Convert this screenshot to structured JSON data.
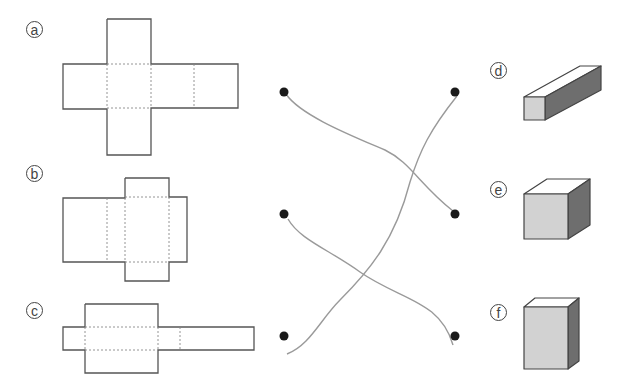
{
  "nets": [
    {
      "id": "a",
      "label": "a",
      "description": "cross-shaped cube net"
    },
    {
      "id": "b",
      "label": "b",
      "description": "box net with short flaps"
    },
    {
      "id": "c",
      "label": "c",
      "description": "long rectangular prism net"
    }
  ],
  "solids": [
    {
      "id": "d",
      "label": "d",
      "description": "long square prism"
    },
    {
      "id": "e",
      "label": "e",
      "description": "cube"
    },
    {
      "id": "f",
      "label": "f",
      "description": "tall rectangular prism"
    }
  ],
  "connections": [
    {
      "from": "a",
      "to": "e"
    },
    {
      "from": "b",
      "to": "f"
    },
    {
      "from": "c",
      "to": "d"
    }
  ],
  "colors": {
    "outline": "#555555",
    "fold_line": "#888888",
    "dot": "#1a1a1a",
    "line": "#9a9a9a",
    "solid_front": "#d2d2d2",
    "solid_side": "#6e6e6e",
    "solid_top": "#ffffff"
  }
}
